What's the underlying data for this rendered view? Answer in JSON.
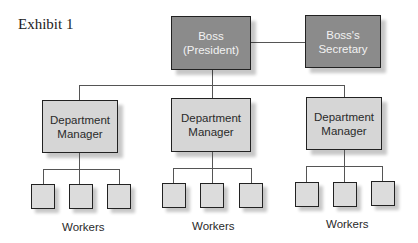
{
  "title": "Exhibit 1",
  "top": {
    "boss": {
      "line1": "Boss",
      "line2": "(President)"
    },
    "secretary": {
      "line1": "Boss's",
      "line2": "Secretary"
    }
  },
  "departments": [
    {
      "line1": "Department",
      "line2": "Manager",
      "workers_label": "Workers",
      "worker_count": 3
    },
    {
      "line1": "Department",
      "line2": "Manager",
      "workers_label": "Workers",
      "worker_count": 3
    },
    {
      "line1": "Department",
      "line2": "Manager",
      "workers_label": "Workers",
      "worker_count": 3
    }
  ],
  "colors": {
    "executive_fill": "#8b8b8b",
    "manager_fill": "#d6d6d6",
    "worker_fill": "#dcdcdc",
    "line": "#555555"
  }
}
